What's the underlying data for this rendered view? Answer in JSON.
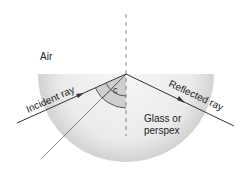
{
  "diagram": {
    "labels": {
      "air": "Air",
      "incident_ray": "Incident ray",
      "reflected_ray": "Reflected ray",
      "medium_line1": "Glass or",
      "medium_line2": "perspex",
      "angle": "c"
    },
    "colors": {
      "block_fill_center": "#f4f4f4",
      "block_fill_edge": "#d4d4d4",
      "angle_fill": "#c8c8c8",
      "ray": "#333333",
      "refracted_ray": "#666666",
      "normal": "#666666",
      "text": "#222222"
    }
  }
}
